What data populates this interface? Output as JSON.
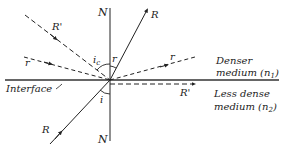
{
  "diagram": {
    "labels": {
      "normal_top": "N",
      "normal_bottom": "N",
      "incident_ray": "R",
      "refracted_ray": "R",
      "critical_ray_incident": "R'",
      "critical_ray_grazing": "R'",
      "small_ray_incident": "r",
      "small_ray_refracted": "r",
      "critical_angle": "i",
      "critical_angle_sub": "c",
      "refraction_angle": "r",
      "incidence_angle": "i",
      "interface": "Interface",
      "denser_line1": "Denser",
      "denser_line2": "medium (n",
      "denser_sub": "1",
      "denser_close": ")",
      "less_line1": "Less dense",
      "less_line2": "medium (n",
      "less_sub": "2",
      "less_close": ")"
    },
    "colors": {
      "line": "#222222",
      "background": "#ffffff"
    }
  }
}
